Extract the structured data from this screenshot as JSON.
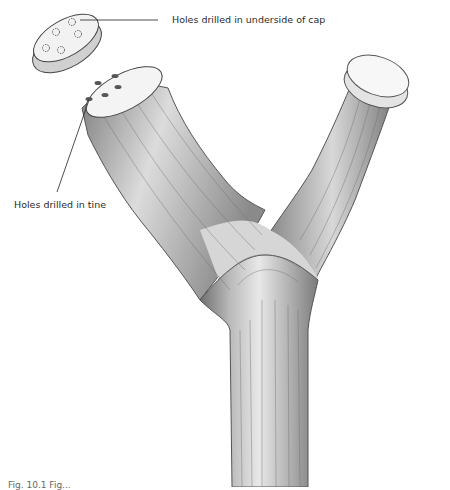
{
  "figure": {
    "labels": {
      "cap": "Holes drilled in underside of cap",
      "tine": "Holes drilled in tine"
    },
    "caption": "Fig. 10.1  Fig..."
  },
  "colors": {
    "background": "#ffffff",
    "wood_light": "#e6e6e6",
    "wood_mid": "#b5b5b5",
    "wood_dark": "#6a6a6a",
    "line": "#333333"
  }
}
